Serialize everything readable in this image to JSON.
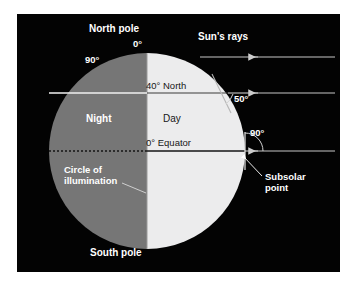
{
  "figure": {
    "background_color": "#ffffff",
    "panel_color": "#030303"
  },
  "earth": {
    "day_label": "Day",
    "night_label": "Night",
    "day_color": "#ececed",
    "night_color": "#767676"
  },
  "labels": {
    "north_pole": "North pole",
    "south_pole": "South pole",
    "pole_zero": "0°",
    "ninety_night": "90°",
    "forty_north": "40° North",
    "angle_fifty": "50°",
    "equator": "0° Equator",
    "angle_ninety": "90°",
    "suns_rays": "Sun's rays",
    "subsolar_line1": "Subsolar",
    "subsolar_line2": "point",
    "circle_line1": "Circle of",
    "circle_line2": "illumination"
  },
  "geometry": {
    "circle_center_x": 147,
    "circle_center_y": 151,
    "circle_radius": 98,
    "terminator_x": 147,
    "equator_y": 151,
    "forty_north_y": 93,
    "ray_ys": [
      57,
      93,
      151
    ],
    "ray_start_x": 335,
    "ray_end_x": 247
  },
  "colors": {
    "white_line": "#f2f2f2",
    "dark_line": "#101010",
    "label_white": "#ffffff",
    "label_dark": "#171717"
  }
}
